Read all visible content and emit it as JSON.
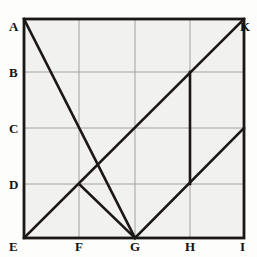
{
  "figure": {
    "background_color": "#fdfdfc",
    "panel_fill": "#f1f1f0",
    "frame_color": "#1a1714",
    "grid_color": "#9a9a96",
    "construction_color": "#1a1714",
    "frame": {
      "x0": 24,
      "y0": 19,
      "x1": 244,
      "y1": 238
    },
    "columns": [
      24,
      79,
      135,
      190,
      244
    ],
    "rows": [
      19,
      72,
      128,
      184,
      238
    ]
  },
  "labels": {
    "left_column": [
      {
        "id": "A",
        "text": "A",
        "x": 9,
        "y": 20
      },
      {
        "id": "B",
        "text": "B",
        "x": 9,
        "y": 66
      },
      {
        "id": "C",
        "text": "C",
        "x": 9,
        "y": 122
      },
      {
        "id": "D",
        "text": "D",
        "x": 9,
        "y": 178
      },
      {
        "id": "E",
        "text": "E",
        "x": 9,
        "y": 240
      }
    ],
    "bottom_row": [
      {
        "id": "F",
        "text": "F",
        "x": 75,
        "y": 240
      },
      {
        "id": "G",
        "text": "G",
        "x": 130,
        "y": 240
      },
      {
        "id": "H",
        "text": "H",
        "x": 185,
        "y": 240
      },
      {
        "id": "I",
        "text": "I",
        "x": 240,
        "y": 240
      }
    ],
    "top_right": [
      {
        "id": "K",
        "text": "K",
        "x": 240,
        "y": 20
      }
    ]
  },
  "grid_lines": {
    "horizontal": [
      {
        "name": "row-B",
        "x1": 24,
        "y1": 72,
        "x2": 244,
        "y2": 72
      },
      {
        "name": "row-C",
        "x1": 24,
        "y1": 128,
        "x2": 244,
        "y2": 128
      },
      {
        "name": "row-D",
        "x1": 24,
        "y1": 184,
        "x2": 244,
        "y2": 184
      }
    ],
    "vertical": [
      {
        "name": "col-F",
        "x1": 79,
        "y1": 19,
        "x2": 79,
        "y2": 238
      },
      {
        "name": "col-G",
        "x1": 135,
        "y1": 19,
        "x2": 135,
        "y2": 238
      },
      {
        "name": "col-H",
        "x1": 190,
        "y1": 19,
        "x2": 190,
        "y2": 238
      }
    ]
  },
  "construction_lines": [
    {
      "name": "diagonal-A-to-G",
      "from": "A",
      "to": "G",
      "x1": 24,
      "y1": 19,
      "x2": 135,
      "y2": 238
    },
    {
      "name": "diagonal-E-to-K",
      "from": "E",
      "to": "K",
      "x1": 24,
      "y1": 238,
      "x2": 244,
      "y2": 19
    },
    {
      "name": "segment-FD-to-G",
      "from": "FD",
      "to": "G",
      "x1": 79,
      "y1": 184,
      "x2": 135,
      "y2": 238
    },
    {
      "name": "segment-G-to-right-C",
      "from": "G",
      "to": "right-C",
      "x1": 135,
      "y1": 238,
      "x2": 244,
      "y2": 128
    },
    {
      "name": "vertical-H-B-to-D",
      "from": "HB",
      "to": "HD",
      "x1": 190,
      "y1": 72,
      "x2": 190,
      "y2": 184
    }
  ]
}
